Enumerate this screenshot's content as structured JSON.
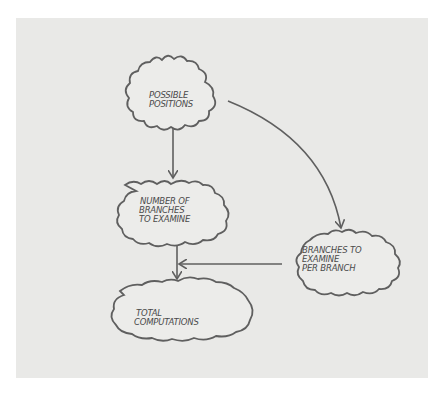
{
  "diagram": {
    "nodes": [
      {
        "id": "possible-positions",
        "lines": [
          "POSSIBLE",
          "POSITIONS"
        ]
      },
      {
        "id": "number-of-branches",
        "lines": [
          "NUMBER OF",
          "BRANCHES",
          "TO EXAMINE"
        ]
      },
      {
        "id": "branches-per-branch",
        "lines": [
          "BRANCHES TO",
          "EXAMINE",
          "PER BRANCH"
        ]
      },
      {
        "id": "total-computations",
        "lines": [
          "TOTAL",
          "COMPUTATIONS"
        ]
      }
    ],
    "edges": [
      {
        "from": "possible-positions",
        "to": "number-of-branches"
      },
      {
        "from": "possible-positions",
        "to": "branches-per-branch"
      },
      {
        "from": "number-of-branches",
        "to": "total-computations"
      },
      {
        "from": "branches-per-branch",
        "to": "total-computations"
      }
    ],
    "colors": {
      "background": "#e9e9e7",
      "stroke": "#5f5f5f",
      "text": "#4a4a4a"
    }
  }
}
